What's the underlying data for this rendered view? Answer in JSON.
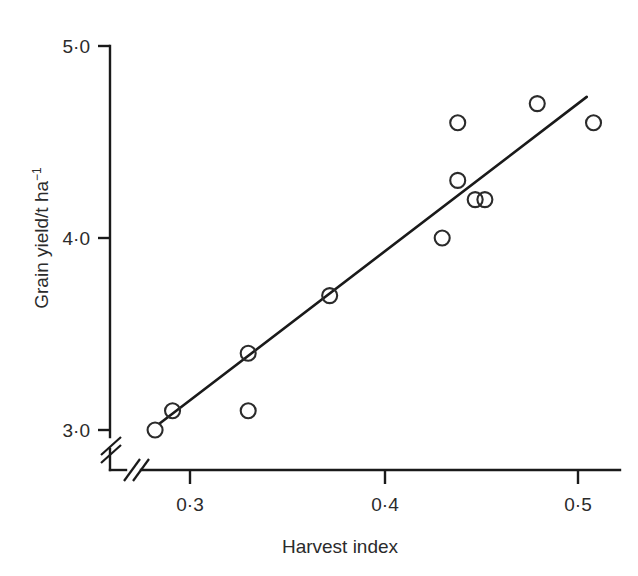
{
  "chart_data": {
    "type": "scatter",
    "title": "",
    "xlabel": "Harvest index",
    "ylabel": "Grain yield/t ha⁻¹",
    "ylabel_main": "Grain yield/t ha",
    "ylabel_exponent": "−1",
    "xlim": [
      0.27,
      0.52
    ],
    "ylim": [
      2.9,
      5.0
    ],
    "xticks": [
      0.3,
      0.4,
      0.5
    ],
    "xtick_labels": [
      "0·3",
      "0·4",
      "0·5"
    ],
    "yticks": [
      3.0,
      4.0,
      5.0
    ],
    "ytick_labels": [
      "3·0",
      "4·0",
      "5·0"
    ],
    "grid": false,
    "legend": null,
    "axis_break_x": true,
    "axis_break_y": true,
    "marker": "open-circle",
    "x": [
      0.282,
      0.291,
      0.33,
      0.33,
      0.372,
      0.43,
      0.438,
      0.438,
      0.447,
      0.452,
      0.479,
      0.508
    ],
    "y": [
      3.0,
      3.1,
      3.4,
      3.1,
      3.7,
      4.0,
      4.6,
      4.3,
      4.2,
      4.2,
      4.7,
      4.6
    ],
    "points": [
      {
        "x": 0.282,
        "y": 3.0
      },
      {
        "x": 0.291,
        "y": 3.1
      },
      {
        "x": 0.33,
        "y": 3.4
      },
      {
        "x": 0.33,
        "y": 3.1
      },
      {
        "x": 0.372,
        "y": 3.7
      },
      {
        "x": 0.43,
        "y": 4.0
      },
      {
        "x": 0.438,
        "y": 4.6
      },
      {
        "x": 0.438,
        "y": 4.3
      },
      {
        "x": 0.447,
        "y": 4.2
      },
      {
        "x": 0.452,
        "y": 4.2
      },
      {
        "x": 0.479,
        "y": 4.7
      },
      {
        "x": 0.508,
        "y": 4.6
      }
    ],
    "series": [
      {
        "name": "regression-line",
        "type": "line",
        "x": [
          0.2845,
          0.5045
        ],
        "y": [
          3.035,
          4.735
        ]
      }
    ],
    "colors": {
      "axis": "#1a1a1a",
      "marker_stroke": "#2b2b2b",
      "line": "#1a1a1a",
      "background": "#ffffff"
    }
  }
}
